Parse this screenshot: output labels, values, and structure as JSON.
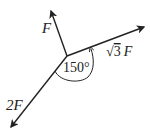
{
  "diagram": {
    "type": "force-vector-diagram",
    "colors": {
      "stroke": "#222222",
      "background": "#ffffff"
    },
    "origin": {
      "x": 67,
      "y": 56
    },
    "vectors": [
      {
        "id": "F",
        "label": "F",
        "tip": {
          "x": 51,
          "y": 10
        }
      },
      {
        "id": "sqrt3F",
        "label_radical": "√",
        "label_radicand": "3",
        "label_symbol": "F",
        "tip": {
          "x": 145,
          "y": 27
        }
      },
      {
        "id": "2F",
        "label": "2F",
        "tip": {
          "x": 10,
          "y": 128
        }
      }
    ],
    "angle": {
      "label": "150°",
      "between": [
        "sqrt3F",
        "2F"
      ]
    }
  }
}
